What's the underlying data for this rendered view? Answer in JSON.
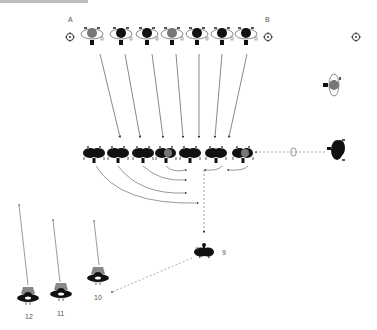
{
  "labels": {
    "a": "A",
    "b": "B",
    "n9": "9",
    "n10": "10",
    "n11": "11",
    "n12": "12"
  },
  "colors": {
    "dark": "#111111",
    "gray": "#7a7a7a",
    "outline": "#9a9a9a",
    "arrow": "#555555",
    "dashed": "#8a8a8a",
    "topbar": "#bdbdbd"
  },
  "top_row": {
    "ring_icons": [
      {
        "x": 58,
        "y": 37
      },
      {
        "x": 268,
        "y": 37
      },
      {
        "x": 356,
        "y": 37
      }
    ],
    "complexes": [
      {
        "x": 90,
        "y": 34,
        "core": "gray"
      },
      {
        "x": 121,
        "y": 34,
        "core": "dark"
      },
      {
        "x": 147,
        "y": 34,
        "core": "dark"
      },
      {
        "x": 172,
        "y": 34,
        "core": "gray"
      },
      {
        "x": 197,
        "y": 34,
        "core": "dark"
      },
      {
        "x": 222,
        "y": 34,
        "core": "dark"
      },
      {
        "x": 246,
        "y": 34,
        "core": "dark"
      }
    ]
  },
  "middle_row": {
    "complexes": [
      {
        "x": 94,
        "y": 153,
        "core": "dark"
      },
      {
        "x": 118,
        "y": 153,
        "core": "dark"
      },
      {
        "x": 142,
        "y": 153,
        "core": "dark"
      },
      {
        "x": 166,
        "y": 153,
        "core": "gray"
      },
      {
        "x": 190,
        "y": 153,
        "core": "dark"
      },
      {
        "x": 216,
        "y": 153,
        "core": "dark"
      },
      {
        "x": 243,
        "y": 153,
        "core": "gray"
      }
    ]
  },
  "side_items": {
    "upright_complex": {
      "x": 334,
      "y": 85
    },
    "small_capsule": {
      "x": 294,
      "y": 152
    },
    "large_dark_complex": {
      "x": 337,
      "y": 150
    }
  },
  "bottom": {
    "node9": {
      "x": 204,
      "y": 251,
      "label": "9"
    },
    "node10": {
      "x": 98,
      "y": 277,
      "label": "10"
    },
    "node11": {
      "x": 62,
      "y": 293,
      "label": "11"
    },
    "node12": {
      "x": 29,
      "y": 296,
      "label": "12"
    }
  }
}
